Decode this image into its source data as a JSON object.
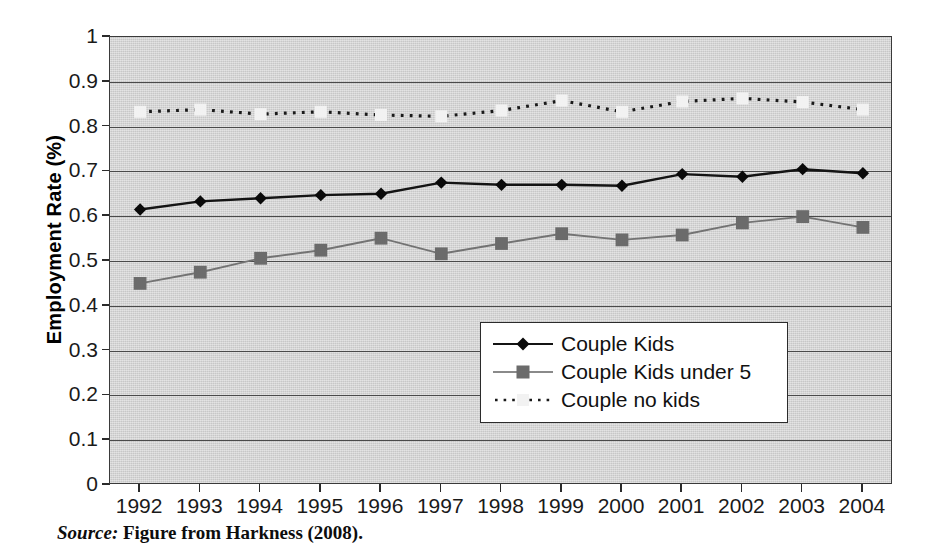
{
  "chart_data": {
    "type": "line",
    "title": "",
    "xlabel": "",
    "ylabel": "Employment Rate (%)",
    "ylim": [
      0,
      1
    ],
    "ytick_step": 0.1,
    "grid": true,
    "legend_position": "center-right",
    "categories": [
      "1992",
      "1993",
      "1994",
      "1995",
      "1996",
      "1997",
      "1998",
      "1999",
      "2000",
      "2001",
      "2002",
      "2003",
      "2004"
    ],
    "x": [
      1992,
      1993,
      1994,
      1995,
      1996,
      1997,
      1998,
      1999,
      2000,
      2001,
      2002,
      2003,
      2004
    ],
    "ytick_labels": [
      "1",
      "0.9",
      "0.8",
      "0.7",
      "0.6",
      "0.5",
      "0.4",
      "0.3",
      "0.2",
      "0.1",
      "0"
    ],
    "ytick_values": [
      1,
      0.9,
      0.8,
      0.7,
      0.6,
      0.5,
      0.4,
      0.3,
      0.2,
      0.1,
      0
    ],
    "series": [
      {
        "name": "Couple Kids",
        "marker": "diamond",
        "line_style": "solid",
        "color": "#141414",
        "marker_color": "#0a0a0a",
        "values": [
          0.615,
          0.633,
          0.64,
          0.647,
          0.65,
          0.675,
          0.67,
          0.67,
          0.668,
          0.694,
          0.688,
          0.705,
          0.696
        ]
      },
      {
        "name": "Couple Kids under 5",
        "marker": "square",
        "line_style": "solid",
        "color": "#737373",
        "marker_color": "#6b6b6b",
        "values": [
          0.45,
          0.475,
          0.506,
          0.524,
          0.551,
          0.516,
          0.539,
          0.561,
          0.547,
          0.558,
          0.585,
          0.599,
          0.575
        ]
      },
      {
        "name": "Couple no kids",
        "marker": "square",
        "line_style": "dotted",
        "color": "#1a1a1a",
        "marker_color": "#f2f2f2",
        "values": [
          0.833,
          0.838,
          0.828,
          0.833,
          0.826,
          0.823,
          0.836,
          0.858,
          0.833,
          0.856,
          0.863,
          0.855,
          0.838
        ]
      }
    ]
  },
  "axis": {
    "y_title": "Employment Rate (%)"
  },
  "legend": {
    "entries": [
      {
        "label": "Couple Kids"
      },
      {
        "label": "Couple Kids under 5"
      },
      {
        "label": "Couple no kids"
      }
    ]
  },
  "caption": {
    "source_label": "Source:",
    "text": "Figure from Harkness (2008)."
  },
  "colors": {
    "plot_background": "#d6d6d6",
    "gridline": "#4a4a4a",
    "axis": "#2b2b2b",
    "series_kids": "#141414",
    "series_under5": "#737373",
    "series_no_kids": "#1a1a1a"
  }
}
